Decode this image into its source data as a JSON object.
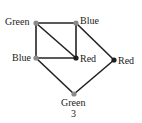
{
  "graph": {
    "caption": "3",
    "nodes": [
      {
        "id": "n1",
        "label": "Green",
        "x": 36,
        "y": 23,
        "shade": "light"
      },
      {
        "id": "n2",
        "label": "Blue",
        "x": 76,
        "y": 23,
        "shade": "light"
      },
      {
        "id": "n3",
        "label": "Blue",
        "x": 36,
        "y": 58,
        "shade": "light"
      },
      {
        "id": "n4",
        "label": "Red",
        "x": 76,
        "y": 58,
        "shade": "dark"
      },
      {
        "id": "n5",
        "label": "Red",
        "x": 114,
        "y": 60,
        "shade": "dark"
      },
      {
        "id": "n6",
        "label": "Green",
        "x": 74,
        "y": 94,
        "shade": "light"
      }
    ],
    "edges": [
      [
        "n1",
        "n2"
      ],
      [
        "n1",
        "n3"
      ],
      [
        "n1",
        "n4"
      ],
      [
        "n2",
        "n4"
      ],
      [
        "n3",
        "n4"
      ],
      [
        "n2",
        "n5"
      ],
      [
        "n3",
        "n6"
      ],
      [
        "n6",
        "n5"
      ]
    ],
    "colors": {
      "edge": "#222222",
      "node_light": "#8a8a8a",
      "node_dark": "#1e1e1e",
      "text": "#222222"
    }
  }
}
